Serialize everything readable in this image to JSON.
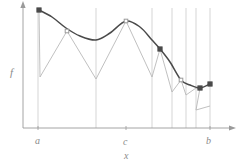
{
  "figure": {
    "title": "",
    "axis_labels": {
      "y": "f",
      "x": "x",
      "tick_a": "a",
      "tick_c": "c",
      "tick_b": "b"
    },
    "colors": {
      "curve": "#4a4a4a",
      "zigzag": "#b9b9b9",
      "gridline": "#c3c3c3",
      "axis": "#9a9a9a",
      "marker_dark": "#4a4a4a",
      "marker_light": "#9a9a9a",
      "background": "#ffffff"
    }
  },
  "chart_data": {
    "type": "line",
    "title": "",
    "xlabel": "x",
    "ylabel": "f",
    "grid": true,
    "legend": null,
    "xlim": [
      23,
      232
    ],
    "ylim": [
      128,
      5
    ],
    "axis": {
      "origin": [
        23,
        128
      ],
      "x_end": [
        232,
        128
      ],
      "y_end": [
        23,
        5
      ],
      "tick_labels": [
        {
          "label": "a",
          "x": 38
        },
        {
          "label": "c",
          "x": 126
        },
        {
          "label": "b",
          "x": 210
        }
      ]
    },
    "gridlines_x": [
      38,
      96,
      152,
      172,
      186,
      196,
      210
    ],
    "series": [
      {
        "name": "f",
        "kind": "smooth-curve",
        "color": "#4a4a4a",
        "points": [
          [
            39,
            10
          ],
          [
            52,
            17
          ],
          [
            66,
            28
          ],
          [
            80,
            36
          ],
          [
            96,
            40
          ],
          [
            110,
            33
          ],
          [
            126,
            21
          ],
          [
            140,
            27
          ],
          [
            152,
            40
          ],
          [
            160,
            49
          ],
          [
            170,
            62
          ],
          [
            181,
            80
          ],
          [
            190,
            85
          ],
          [
            200,
            88
          ],
          [
            210,
            84
          ]
        ]
      },
      {
        "name": "piecewise-approximation",
        "kind": "zigzag",
        "color": "#b9b9b9",
        "segments": [
          [
            [
              39,
              10
            ],
            [
              40,
              77
            ],
            [
              67,
              31
            ],
            [
              96,
              79
            ]
          ],
          [
            [
              96,
              79
            ],
            [
              126,
              21
            ],
            [
              152,
              77
            ]
          ],
          [
            [
              152,
              77
            ],
            [
              160,
              49
            ],
            [
              172,
              92
            ]
          ],
          [
            [
              172,
              92
            ],
            [
              181,
              80
            ],
            [
              186,
              95
            ]
          ],
          [
            [
              186,
              95
            ],
            [
              196,
              88
            ],
            [
              200,
              88
            ],
            [
              196,
              110
            ],
            [
              210,
              106
            ]
          ]
        ]
      }
    ],
    "markers": [
      {
        "x": 39,
        "y": 10,
        "style": "dark"
      },
      {
        "x": 67,
        "y": 31,
        "style": "light"
      },
      {
        "x": 126,
        "y": 21,
        "style": "light"
      },
      {
        "x": 160,
        "y": 49,
        "style": "dark"
      },
      {
        "x": 181,
        "y": 80,
        "style": "light"
      },
      {
        "x": 200,
        "y": 88,
        "style": "dark"
      },
      {
        "x": 210,
        "y": 84,
        "style": "dark"
      }
    ]
  }
}
